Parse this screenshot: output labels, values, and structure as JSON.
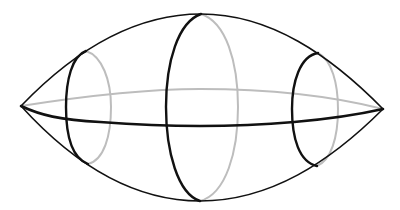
{
  "diagram": {
    "title": "",
    "colors": {
      "background": "#ffffff",
      "front_stroke": "#111111",
      "hidden_stroke": "#bdbdbd"
    },
    "shape": {
      "left_tip": [
        21,
        106
      ],
      "right_tip": [
        383,
        109
      ],
      "top": [
        201,
        14
      ],
      "bottom": [
        200,
        201
      ]
    },
    "cross_sections": [
      {
        "name": "left-section",
        "front_x": 66,
        "back_x": 111,
        "top": [
          86,
          51
        ],
        "bottom": [
          88,
          164
        ]
      },
      {
        "name": "middle-section",
        "front_x": 166,
        "back_x": 238,
        "top": [
          201,
          14
        ],
        "bottom": [
          200,
          201
        ]
      },
      {
        "name": "right-section",
        "front_x": 292,
        "back_x": 338,
        "top": [
          318,
          53
        ],
        "bottom": [
          317,
          166
        ]
      }
    ],
    "equator": {
      "front_mid_y": 126,
      "back_mid_y": 89
    }
  }
}
